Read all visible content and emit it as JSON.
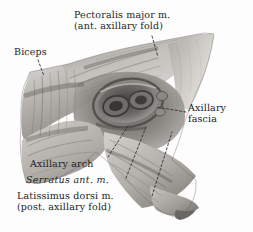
{
  "figure": {
    "kind": "anatomical-illustration",
    "background_color": "#fdfdfd",
    "ink_color": "#221f1d",
    "width": 253,
    "height": 232
  },
  "labels": {
    "pectoralis": {
      "line1": "Pectoralis major m.",
      "line2": "(ant. axillary fold)"
    },
    "biceps": {
      "line1": "Biceps"
    },
    "axillary_fascia": {
      "line1": "Axillary",
      "line2": "fascia"
    },
    "axillary_arch": {
      "line1": "Axillary arch"
    },
    "serratus": {
      "line1": "Serratus ant. m."
    },
    "latissimus": {
      "line1": "Latissimus dorsi m.",
      "line2": "(post. axillary fold)"
    }
  },
  "palette": {
    "shade_darkest": "#4a4a4a",
    "shade_dark": "#767676",
    "shade_mid": "#a2a2a2",
    "shade_light": "#c9c7c4",
    "shade_lightest": "#e8e6e3",
    "leader_line": "#2a2826"
  }
}
